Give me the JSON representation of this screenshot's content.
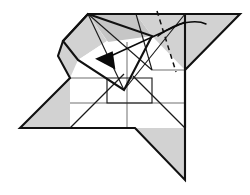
{
  "figure": {
    "kind": "origami-step",
    "caption": "",
    "canvas": {
      "width": 250,
      "height": 195,
      "background": "#ffffff"
    }
  },
  "palette": {
    "paper_front": "#ffffff",
    "paper_back": "#d2d2d2",
    "paper_back_shade": "#c6c6c6",
    "outline": "#111111",
    "crease": "#555555",
    "arrow": "#0a0a0a"
  },
  "shapes": {
    "left_wing": {
      "name": "left-wing",
      "fill": "#d2d2d2",
      "points": "20,128 70,78 70,128"
    },
    "left_hood_upper": {
      "name": "left-hood-upper-flap",
      "fill": "#d2d2d2",
      "points": "63,41 88,14 107,41 78,60"
    },
    "left_hood_lower": {
      "name": "left-hood-lower-flap",
      "fill": "#d2d2d2",
      "points": "63,41 78,60 70,78 58,56"
    },
    "top_center_gray": {
      "name": "top-center-gray-flap",
      "fill": "#c6c6c6",
      "points": "88,14 136,14 152,36 108,42"
    },
    "top_right_gray": {
      "name": "top-right-gray-flap",
      "fill": "#d2d2d2",
      "points": "136,14 185,14 185,70 152,36"
    },
    "right_wing": {
      "name": "right-wing",
      "fill": "#d2d2d2",
      "points": "185,14 240,14 185,70"
    },
    "tail": {
      "name": "bottom-tail",
      "fill": "#d2d2d2",
      "points": "135,128 185,128 185,180"
    },
    "inner_rotated_flap": {
      "name": "inner-rotated-square-flap",
      "fill": "#ffffff",
      "points": "78,60 107,41 152,70 124,90"
    },
    "body_white": {
      "name": "body-white-face",
      "points": "70,78 70,128 185,128 185,70 152,36 108,42 78,60"
    }
  },
  "outline_paths": {
    "silhouette": "M20,128 L70,78 L58,56 L63,41 L88,14 L240,14 L185,70 L185,180 L135,128 L70,128 Z",
    "hood_outline": "M63,41 L88,14 L152,36 L124,90 L78,60 Z",
    "right_vertical_edge": "M185,14 L185,128"
  },
  "creases": [
    {
      "name": "crease-horizontal-mid",
      "d": "M70,103 L185,103"
    },
    {
      "name": "crease-vertical-mid",
      "d": "M127,42 L127,128"
    },
    {
      "name": "crease-left-horizontal",
      "d": "M70,78 L107,78"
    },
    {
      "name": "crease-right-horizontal",
      "d": "M152,70 L185,70"
    },
    {
      "name": "crease-diag-bl",
      "d": "M70,128 L124,74"
    },
    {
      "name": "crease-diag-br",
      "d": "M185,128 L133,76"
    },
    {
      "name": "crease-center-box",
      "d": "M107,78 L152,78 L152,103 L107,103 Z"
    },
    {
      "name": "crease-diag-tl-inner",
      "d": "M88,14 L124,90"
    },
    {
      "name": "crease-diag-tr-inner",
      "d": "M185,14 L124,90"
    },
    {
      "name": "crease-top-fan-left",
      "d": "M88,14 L152,70"
    },
    {
      "name": "crease-top-fan-right",
      "d": "M136,14 L152,70"
    }
  ],
  "fold_markers": {
    "valley_fold_dashed": {
      "name": "valley-fold-dashed-line",
      "label": "valley fold",
      "d": "M157,11 L176,72"
    }
  },
  "arrows": [
    {
      "name": "fold-arrow-main",
      "label": "fold this flap to the left",
      "shaft": "M185,22 L102,60",
      "head": "97,55 120,55 108,70",
      "head_rotation_deg": 208
    },
    {
      "name": "rotate-arrow-curve",
      "label": "swing right wing",
      "d": "M158,36 C178,20 198,20 206,24"
    }
  ],
  "annotations": []
}
